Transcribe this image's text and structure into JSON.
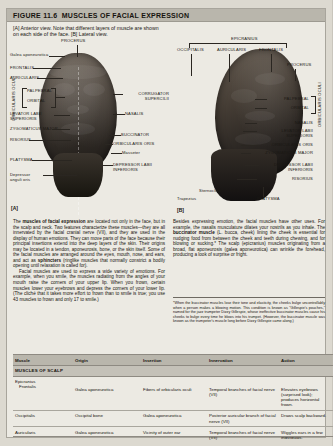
{
  "figure": {
    "number": "FIGURE 11.6",
    "title": "MUSCLES OF FACIAL EXPRESSION",
    "caption": "[A] Anterior view. Note that different layers of muscle are shown on each side of the face. [B] Lateral view.",
    "panel_a_letter": "[A]",
    "panel_b_letter": "[B]"
  },
  "panel_a": {
    "top_label": "PROCERUS",
    "left_labels": [
      "Galea aponeurotica",
      "FRONTALIS",
      "AURICULARIS",
      "PALPEBRAL",
      "ORBITAL",
      "LEVATOR LABII SUPERIORIS",
      "ZYGOMATICUS MAJOR",
      "RISORIUS",
      "PLATYSMA",
      "Depressor anguli oris"
    ],
    "left_bracket_label": "ORBICULARIS OCULI",
    "right_labels": [
      "CORRUGATOR SUPERCILII",
      "NASALIS",
      "BUCCINATOR",
      "ORBICULARIS ORIS",
      "Masseter",
      "DEPRESSOR LABII INFERIORIS"
    ]
  },
  "panel_b": {
    "epicranius": "EPICRANIUS",
    "epicranius_parts": [
      "OCCIPITALIS",
      "AURICULARIS",
      "FRONTALIS"
    ],
    "procerus": "PROCERUS",
    "orbicularis_oculi": "ORBICULARIS OCULI",
    "orbicularis_parts": [
      "PALPEBRAL",
      "ORBITAL"
    ],
    "right_labels": [
      "NASALIS",
      "LEVATOR LABII SUPERIORIS",
      "ORBICULARIS ORIS",
      "ZYGOMATICUS MAJOR",
      "DEPRESSOR LABII INFERIORIS",
      "RISORIUS"
    ],
    "bottom_labels": [
      "Trapezius",
      "Sternocleidomastoid",
      "PLATYSMA"
    ]
  },
  "body": {
    "left_p1_lead": "The ",
    "left_p1_bold": "muscles of facial expression",
    "left_p1_rest": " are located not only in the face, but in the scalp and neck. Two features characterize these muscles—they are all innervated by the facial cranial nerve (VII), and they are used in the display of human emotions. They can move parts of the face because their principal insertions extend into the deep layers of the skin. Their origins may be located in a tendon, aponeurosis, bone, or the skin itself. Some of the facial muscles are arranged around the eyes, mouth, nose, and ears, and act as ",
    "left_p1_bold2": "sphincters",
    "left_p1_rest2": " (ringlike muscles that normally constrict a bodily opening until relaxation is called for).",
    "left_p2": "Facial muscles are used to express a wide variety of emotions. For example, when you smile, the muscles radiating from the angles of your mouth raise the corners of your upper lip. When you frown, certain muscles lower your eyebrows and depress the corners of your lower lip. (The cliché that it takes more effort to frown than to smile is true; you use 43 muscles to frown and only 17 to smile.)",
    "right_p1_a": "Besides expressing emotion, the facial muscles have other uses. For example, the nasalis musculature dilates your nostrils as you inhale. The ",
    "right_p1_bold": "buccinator muscle",
    "right_p1_b": " (L. bucca, cheek) lining the cheek is essential for nudging food from between the cheek and teeth during chewing, and for blowing or sucking.* The scalp (epicranius) muscles originating from a broad, flat aponeurosis (galea aponeurotica) can wrinkle the forehead, producing a look of surprise or fright.",
    "footnote": "*When the buccinator muscles lose their tone and elasticity, the cheeks bulge uncontrollably when a person makes a blowing motion. This condition is known as \"Gillespie's pouches,\" named for the jazz trumpeter Dizzy Gillespie, whose ineffective buccinator muscles cause his cheeks to bulge every time he blows into his trumpet. (However, the buccinator muscle was known as the trumpeter's muscle long before Dizzy Gillespie came along.)"
  },
  "table": {
    "headers": [
      "Muscle",
      "Origin",
      "Insertion",
      "Innervation",
      "Action"
    ],
    "section_title": "MUSCLES OF SCALP",
    "group_label": "Epicranius",
    "rows": [
      {
        "muscle": "Frontalis",
        "indent": true,
        "origin": "Galea aponeurotica",
        "insertion": "Fibers of orbicularis oculi",
        "innervation": "Temporal branches of facial nerve (VII)",
        "action": "Elevates eyebrows (surprised look); produces horizontal frown."
      },
      {
        "muscle": "Occipitalis",
        "indent": false,
        "origin": "Occipital bone",
        "insertion": "Galea aponeurotica",
        "innervation": "Posterior auricular branch of facial nerve (VII)",
        "action": "Draws scalp backward."
      },
      {
        "muscle": "Auricularis",
        "indent": false,
        "origin": "Galea aponeurotica",
        "insertion": "Vicinity of outer ear",
        "innervation": "Temporal branches of facial nerve (VII)",
        "action": "Wiggles ears in a few individuals."
      }
    ]
  },
  "colors": {
    "page_bg": "#dcd9d0",
    "sheet_bg": "#eceae3",
    "header_band": "#b9b6ac",
    "section_band": "#c4c1b8",
    "text": "#17140f"
  }
}
